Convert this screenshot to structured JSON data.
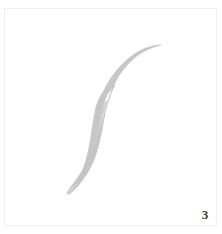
{
  "figure": {
    "number_label": "3",
    "caption": "",
    "background_color": "#ffffff",
    "border_color": "#f1f1f1",
    "number_color": "#3a3a3a"
  },
  "specimen": {
    "name": "nematode-worm-specimen",
    "description": "Elongate sigmoid worm-like organism, pale grey, tapering at both ends",
    "fill_color": "#d2d2d2",
    "fill_color_dense": "#c4c4c4",
    "fill_color_pale": "#e0e0e0",
    "edge_color": "#bdbdbd",
    "anterior_tip": {
      "x": 161,
      "y": 45
    },
    "posterior_tip": {
      "x": 67,
      "y": 194
    },
    "widest_point": {
      "x": 108,
      "y": 128
    },
    "max_width_px": 40
  }
}
